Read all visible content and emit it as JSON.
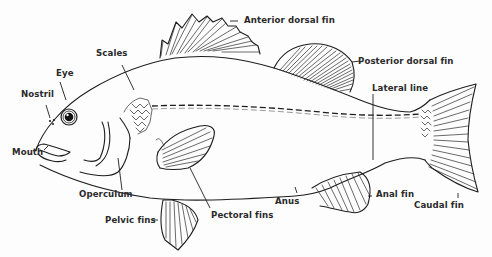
{
  "diagram": {
    "labels": {
      "anterior_dorsal_fin": "Anterior dorsal fin",
      "posterior_dorsal_fin": "Posterior dorsal fin",
      "scales": "Scales",
      "eye": "Eye",
      "nostril": "Nostril",
      "lateral_line": "Lateral line",
      "mouth": "Mouth",
      "operculum": "Operculum",
      "pectoral_fins": "Pectoral fins",
      "pelvic_fins": "Pelvic fins",
      "anus": "Anus",
      "anal_fin": "Anal fin",
      "caudal_fin": "Caudal fin"
    },
    "colors": {
      "line": "#1e1e1e",
      "text": "#2a2a2a",
      "background": "#fdfdfd"
    }
  }
}
